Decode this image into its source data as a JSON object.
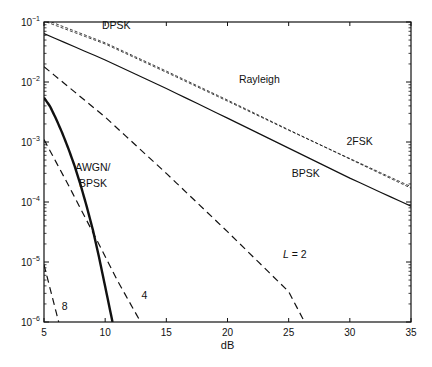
{
  "chart_data": {
    "type": "line",
    "title": "",
    "xlabel": "dB",
    "ylabel": "",
    "xlim": [
      5,
      35
    ],
    "ylim": [
      1e-06,
      0.1
    ],
    "yscale": "log",
    "grid": false,
    "x_ticks": [
      5,
      10,
      15,
      20,
      25,
      30,
      35
    ],
    "x_tick_labels": [
      "5",
      "10",
      "15",
      "20",
      "25",
      "30",
      "35"
    ],
    "y_ticks": [
      0.1,
      0.01,
      0.001,
      0.0001,
      1e-05,
      1e-06
    ],
    "y_tick_labels": [
      {
        "base": "10",
        "exp": "−1"
      },
      {
        "base": "10",
        "exp": "−2"
      },
      {
        "base": "10",
        "exp": "−3"
      },
      {
        "base": "10",
        "exp": "−4"
      },
      {
        "base": "10",
        "exp": "−5"
      },
      {
        "base": "10",
        "exp": "−6"
      }
    ],
    "series": [
      {
        "name": "DPSK",
        "style": "short-dash",
        "weight": "thin",
        "x": [
          5.6,
          10,
          15,
          20,
          25,
          30,
          35
        ],
        "y": [
          0.1,
          0.045,
          0.0152,
          0.005,
          0.0016,
          0.00052,
          0.00017
        ]
      },
      {
        "name": "2FSK",
        "style": "short-dash",
        "weight": "thin",
        "x": [
          5.2,
          10,
          15,
          20,
          25,
          30,
          35
        ],
        "y": [
          0.1,
          0.043,
          0.0145,
          0.0048,
          0.00157,
          0.00053,
          0.00018
        ]
      },
      {
        "name": "BPSK (Rayleigh)",
        "style": "solid",
        "weight": "normal",
        "x": [
          5,
          10,
          15,
          20,
          25,
          30,
          35
        ],
        "y": [
          0.064,
          0.0233,
          0.0078,
          0.0025,
          0.00079,
          0.00025,
          8.5e-05
        ]
      },
      {
        "name": "L = 2",
        "style": "long-dash",
        "weight": "normal",
        "x": [
          5,
          10,
          15,
          20,
          25,
          26.3
        ],
        "y": [
          0.018,
          0.0026,
          0.0003,
          3.2e-05,
          3.2e-06,
          1e-06
        ]
      },
      {
        "name": "L = 4",
        "style": "long-dash",
        "weight": "normal",
        "x": [
          5,
          7,
          9,
          11,
          12.9
        ],
        "y": [
          0.0011,
          0.00019,
          3.1e-05,
          4.9e-06,
          1e-06
        ]
      },
      {
        "name": "L = 8",
        "style": "long-dash",
        "weight": "normal",
        "x": [
          5,
          6.2
        ],
        "y": [
          9e-06,
          1e-06
        ]
      },
      {
        "name": "AWGN/BPSK",
        "style": "solid",
        "weight": "bold",
        "x": [
          5,
          5.5,
          6,
          6.5,
          7,
          7.5,
          8,
          8.5,
          9,
          9.5,
          10,
          10.6
        ],
        "y": [
          0.0055,
          0.0039,
          0.0024,
          0.0014,
          0.00077,
          0.0004,
          0.00019,
          8.3e-05,
          3.4e-05,
          1.2e-05,
          3.9e-06,
          1e-06
        ]
      }
    ],
    "annotations": [
      {
        "text": "DPSK",
        "x": 10.9,
        "y": 0.075
      },
      {
        "text": "Rayleigh",
        "x": 22.6,
        "y": 0.0096
      },
      {
        "text": "2FSK",
        "x": 30.8,
        "y": 0.00088
      },
      {
        "text": "BPSK",
        "x": 26.4,
        "y": 0.00026
      },
      {
        "text": "AWGN/",
        "x": 9.0,
        "y": 0.00033
      },
      {
        "text": "BPSK",
        "x": 9.0,
        "y": 0.00018
      },
      {
        "text": "L = 2",
        "x": 25.5,
        "y": 1.15e-05
      },
      {
        "text": "4",
        "x": 13.2,
        "y": 2.4e-06
      },
      {
        "text": "8",
        "x": 6.7,
        "y": 1.6e-06
      }
    ]
  }
}
